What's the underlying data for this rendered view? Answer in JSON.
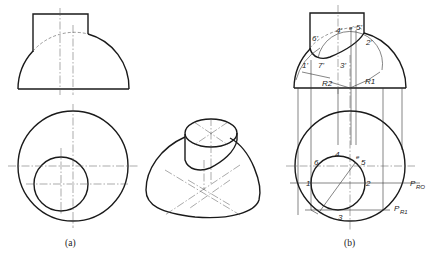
{
  "figure": {
    "type": "engineering orthographic projection",
    "captions": {
      "a": "(a)",
      "b": "(b)"
    }
  },
  "panel_a": {
    "front_view": "front-view-a",
    "top_view": "top-view-a",
    "isometric": "isometric-view"
  },
  "panel_b": {
    "front_labels": [
      "1'",
      "2'",
      "3'",
      "4'",
      "5'",
      "6'",
      "7'",
      "e'"
    ],
    "radius_labels": [
      "R1",
      "R2"
    ],
    "top_labels": [
      "1",
      "2",
      "3",
      "4",
      "5",
      "6",
      "e"
    ],
    "plane_labels": [
      "P",
      "RO",
      "P",
      "R1"
    ]
  },
  "colors": {
    "line": "#1a1a1a",
    "background": "#ffffff"
  }
}
